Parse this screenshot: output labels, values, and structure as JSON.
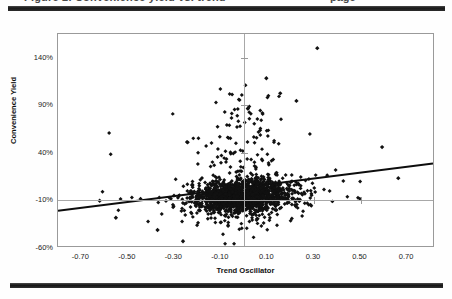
{
  "page": {
    "clipped_header_left": "Figure 2. Convenience yield vs. trend",
    "clipped_header_right": "page"
  },
  "chart_data": {
    "type": "scatter",
    "title": "",
    "xlabel": "Trend Oscillator",
    "ylabel": "Convenience Yield",
    "xlim": [
      -0.8,
      0.82
    ],
    "ylim": [
      -0.6,
      1.65
    ],
    "xticks": [
      -0.7,
      -0.5,
      -0.3,
      -0.1,
      0.1,
      0.3,
      0.5,
      0.7
    ],
    "xticklabels": [
      "-0.70",
      "-0.50",
      "-0.30",
      "-0.10",
      "0.10",
      "0.30",
      "0.50",
      "0.70"
    ],
    "yticks": [
      1.4,
      0.9,
      0.4,
      -0.1,
      -0.6
    ],
    "yticklabels": [
      "140%",
      "90%",
      "40%",
      "-10%",
      "-60%"
    ],
    "grid": false,
    "reference_lines": [
      {
        "axis": "vertical",
        "value": 0.0,
        "color": "#a8a8a8"
      },
      {
        "axis": "horizontal",
        "value": -0.1,
        "color": "#a8a8a8"
      }
    ],
    "marker": {
      "shape": "diamond",
      "size": 2.0,
      "color": "#111111"
    },
    "trendline": {
      "type": "linear",
      "color": "#0d0d0d",
      "width": 2.0,
      "x_start": -0.8,
      "y_start": -0.225,
      "x_end": 0.82,
      "y_end": 0.275,
      "slope": 0.3086,
      "intercept": 0.0219
    },
    "n_points": 1700,
    "cluster": {
      "x_center": -0.005,
      "y_center": -0.075,
      "x_spread": 0.105,
      "y_spread": 0.085,
      "description": "dense elongated cloud centred slightly left of zero just above -10%, with a long sparse upper tail of outliers reaching 150% and scattered low points down to -60%"
    },
    "notable_outliers": [
      {
        "x": 0.32,
        "y": 1.5
      },
      {
        "x": 0.1,
        "y": 1.18
      },
      {
        "x": 0.16,
        "y": 1.02
      },
      {
        "x": 0.23,
        "y": 0.94
      },
      {
        "x": 0.02,
        "y": 0.86
      },
      {
        "x": -0.24,
        "y": 0.5
      },
      {
        "x": 0.6,
        "y": 0.45
      },
      {
        "x": 0.67,
        "y": 0.12
      },
      {
        "x": -0.62,
        "y": -0.12
      },
      {
        "x": -0.55,
        "y": -0.3
      },
      {
        "x": -0.37,
        "y": -0.43
      },
      {
        "x": -0.26,
        "y": -0.55
      }
    ]
  }
}
